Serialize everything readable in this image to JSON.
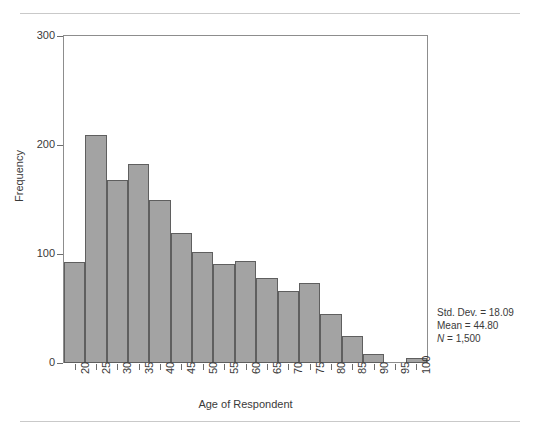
{
  "figure": {
    "background_color": "#ffffff",
    "rule_color": "#c9c9c9",
    "bar_fill_color": "#a3a3a3",
    "bar_border_color": "#5f5f5f",
    "axis_color": "#6d6d6d"
  },
  "axes": {
    "y_title": "Frequency",
    "x_title": "Age of Respondent",
    "y_ticks": [
      "0",
      "100",
      "200",
      "300"
    ],
    "x_ticks": [
      "20",
      "25",
      "30",
      "35",
      "40",
      "45",
      "50",
      "55",
      "60",
      "65",
      "70",
      "75",
      "80",
      "85",
      "90",
      "95",
      "100"
    ]
  },
  "stats": {
    "std_dev_label": "Std. Dev. = 18.09",
    "mean_label": "Mean = 44.80",
    "n_symbol": "N",
    "n_value": " = 1,500"
  },
  "chart_data": {
    "type": "bar",
    "title": "",
    "subtitle": "",
    "xlabel": "Age of Respondent",
    "ylabel": "Frequency",
    "xlim": [
      17.5,
      102.5
    ],
    "ylim": [
      0,
      300
    ],
    "grid": false,
    "legend": "none",
    "bin_width": 5,
    "bin_starts": [
      17.5,
      22.5,
      27.5,
      32.5,
      37.5,
      42.5,
      47.5,
      52.5,
      57.5,
      62.5,
      67.5,
      72.5,
      77.5,
      82.5,
      87.5,
      92.5,
      97.5
    ],
    "categories": [
      "20",
      "25",
      "30",
      "35",
      "40",
      "45",
      "50",
      "55",
      "60",
      "65",
      "70",
      "75",
      "80",
      "85",
      "90",
      "95",
      "100"
    ],
    "values": [
      93,
      209,
      168,
      183,
      150,
      119,
      102,
      91,
      94,
      78,
      66,
      73,
      45,
      25,
      8,
      0,
      5
    ],
    "annotations": [
      "Std. Dev. = 18.09",
      "Mean = 44.80",
      "N = 1,500"
    ]
  }
}
